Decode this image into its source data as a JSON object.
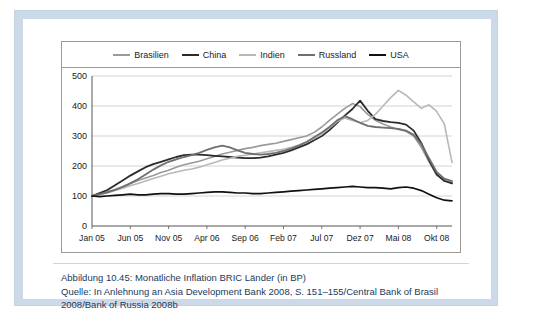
{
  "caption": {
    "line1": "Abbildung 10.45:  Monatliche Inflation BRIC Länder (in BP)",
    "line2": "Quelle: In Anlehnung an Asia Development Bank 2008, S. 151–155/Central Bank of Brasil",
    "line3": "2008/Bank of Russia 2008b"
  },
  "chart_data": {
    "type": "line",
    "title": "Monatliche Inflation BRIC Länder (in BP)",
    "xlabel": "",
    "ylabel": "",
    "ylim": [
      0,
      500
    ],
    "yticks": [
      0,
      100,
      200,
      300,
      400,
      500
    ],
    "grid": true,
    "legend_position": "top",
    "x_tick_labels": [
      "Jan 05",
      "Jun 05",
      "Nov 05",
      "Apr 06",
      "Sep 06",
      "Feb 07",
      "Jul 07",
      "Dez 07",
      "Mai 08",
      "Okt 08"
    ],
    "x_tick_indices": [
      0,
      5,
      10,
      15,
      20,
      25,
      30,
      35,
      40,
      45
    ],
    "x": [
      "Jan 05",
      "Feb 05",
      "Mrz 05",
      "Apr 05",
      "Mai 05",
      "Jun 05",
      "Jul 05",
      "Aug 05",
      "Sep 05",
      "Okt 05",
      "Nov 05",
      "Dez 05",
      "Jan 06",
      "Feb 06",
      "Mrz 06",
      "Apr 06",
      "Mai 06",
      "Jun 06",
      "Jul 06",
      "Aug 06",
      "Sep 06",
      "Okt 06",
      "Nov 06",
      "Dez 06",
      "Jan 07",
      "Feb 07",
      "Mrz 07",
      "Apr 07",
      "Mai 07",
      "Jun 07",
      "Jul 07",
      "Aug 07",
      "Sep 07",
      "Okt 07",
      "Nov 07",
      "Dez 07",
      "Jan 08",
      "Feb 08",
      "Mrz 08",
      "Apr 08",
      "Mai 08",
      "Jun 08",
      "Jul 08",
      "Aug 08",
      "Sep 08",
      "Okt 08",
      "Nov 08",
      "Dez 08"
    ],
    "series": [
      {
        "name": "Brasilien",
        "color": "#9a9a9a",
        "width": 1.6,
        "values": [
          100,
          108,
          115,
          122,
          132,
          142,
          152,
          160,
          168,
          178,
          186,
          196,
          204,
          210,
          216,
          224,
          232,
          240,
          246,
          252,
          258,
          262,
          268,
          272,
          276,
          282,
          288,
          294,
          300,
          312,
          330,
          352,
          372,
          392,
          408,
          398,
          372,
          352,
          340,
          330,
          322,
          316,
          300,
          262,
          214,
          170,
          152,
          146
        ]
      },
      {
        "name": "China",
        "color": "#2b2b2b",
        "width": 1.8,
        "values": [
          100,
          110,
          120,
          136,
          152,
          168,
          182,
          196,
          206,
          214,
          222,
          230,
          236,
          238,
          238,
          236,
          234,
          232,
          230,
          228,
          226,
          226,
          228,
          232,
          238,
          244,
          252,
          262,
          272,
          286,
          300,
          320,
          344,
          368,
          390,
          418,
          384,
          356,
          350,
          346,
          344,
          338,
          318,
          276,
          220,
          172,
          150,
          142
        ]
      },
      {
        "name": "Indien",
        "color": "#b8b8b8",
        "width": 1.6,
        "values": [
          100,
          104,
          110,
          118,
          126,
          134,
          142,
          150,
          158,
          166,
          174,
          180,
          186,
          190,
          196,
          204,
          212,
          220,
          226,
          232,
          236,
          240,
          244,
          248,
          252,
          256,
          262,
          270,
          280,
          292,
          306,
          326,
          348,
          360,
          352,
          344,
          352,
          372,
          400,
          428,
          452,
          436,
          414,
          392,
          404,
          382,
          340,
          212
        ]
      },
      {
        "name": "Russland",
        "color": "#6f6f6f",
        "width": 1.8,
        "values": [
          100,
          106,
          112,
          120,
          130,
          142,
          156,
          172,
          188,
          202,
          214,
          222,
          230,
          236,
          244,
          254,
          262,
          268,
          262,
          252,
          244,
          240,
          238,
          240,
          244,
          250,
          258,
          268,
          280,
          296,
          312,
          330,
          352,
          366,
          356,
          344,
          334,
          330,
          328,
          326,
          324,
          318,
          304,
          272,
          226,
          180,
          158,
          150
        ]
      },
      {
        "name": "USA",
        "color": "#111111",
        "width": 1.7,
        "values": [
          100,
          98,
          100,
          102,
          104,
          106,
          104,
          104,
          106,
          108,
          108,
          106,
          106,
          108,
          110,
          112,
          114,
          114,
          112,
          110,
          110,
          108,
          108,
          110,
          112,
          114,
          116,
          118,
          120,
          122,
          124,
          126,
          128,
          130,
          132,
          130,
          128,
          128,
          126,
          124,
          128,
          130,
          126,
          118,
          106,
          94,
          86,
          84
        ]
      }
    ]
  },
  "legend": [
    {
      "label": "Brasilien",
      "color": "#9a9a9a"
    },
    {
      "label": "China",
      "color": "#2b2b2b"
    },
    {
      "label": "Indien",
      "color": "#b8b8b8"
    },
    {
      "label": "Russland",
      "color": "#6f6f6f"
    },
    {
      "label": "USA",
      "color": "#111111"
    }
  ]
}
